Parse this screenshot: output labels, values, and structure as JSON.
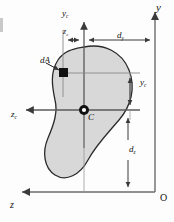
{
  "figure": {
    "type": "engineering-diagram",
    "background": "#fdfdfd",
    "area_fill": "#d8d8d8",
    "area_stroke": "#2b2b2b",
    "line_color": "#5a5a5a",
    "text_color": "#111111"
  },
  "labels": {
    "axis_y": "y",
    "axis_z": "z",
    "origin": "O",
    "axis_yc": "y",
    "axis_yc_sub": "c",
    "axis_zc": "z",
    "axis_zc_sub": "c",
    "dim_zc": "z",
    "dim_zc_sub": "c",
    "dim_yc": "y",
    "dim_yc_sub": "c",
    "dim_dy": "d",
    "dim_dy_sub": "y",
    "dim_dz": "d",
    "dim_dz_sub": "z",
    "element_dA": "dA",
    "centroid": "C"
  },
  "geometry": {
    "origin_x": 155,
    "origin_y": 192,
    "centroid_x": 84,
    "centroid_y": 110,
    "element_x": 63,
    "element_y": 73,
    "dim_dy_from": 84,
    "dim_dy_to": 155,
    "dim_dz_from": 110,
    "dim_dz_to": 192,
    "dim_zc_from": 63,
    "dim_zc_to": 84,
    "dim_yc_from": 73,
    "dim_yc_to": 110
  }
}
